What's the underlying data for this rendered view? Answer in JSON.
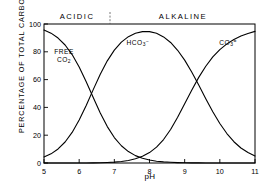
{
  "chart_data": {
    "type": "line",
    "title": "",
    "xlabel": "pH",
    "ylabel": "PERCENTAGE OF TOTAL CARBON",
    "xlim": [
      5,
      11
    ],
    "ylim": [
      0,
      100
    ],
    "xticks": [
      "5",
      "6",
      "7",
      "8",
      "9",
      "10",
      "11"
    ],
    "yticks": [
      "0",
      "20",
      "40",
      "60",
      "80",
      "100"
    ],
    "grid": false,
    "legend_position": "inline-annotations",
    "annotations": {
      "acidic": "ACIDIC",
      "alkaline": "ALKALINE",
      "divider_ph": 7,
      "free_co2_line1": "FREE",
      "free_co2_line2": "CO",
      "free_co2_sub": "2",
      "hco3_text": "HCO",
      "hco3_sub": "3",
      "hco3_sup": "−",
      "co3_text": "CO",
      "co3_sub": "3",
      "co3_sup": "="
    },
    "pka1": 6.35,
    "pka2": 9.1,
    "x": [
      5.0,
      5.2,
      5.4,
      5.6,
      5.8,
      6.0,
      6.2,
      6.4,
      6.6,
      6.8,
      7.0,
      7.2,
      7.4,
      7.6,
      7.8,
      8.0,
      8.2,
      8.4,
      8.6,
      8.8,
      9.0,
      9.2,
      9.4,
      9.6,
      9.8,
      10.0,
      10.2,
      10.4,
      10.6,
      10.8,
      11.0
    ],
    "series": [
      {
        "name": "FREE CO2",
        "color": "#000000",
        "values": [
          95.7,
          93.4,
          89.9,
          84.9,
          78.0,
          69.1,
          58.5,
          47.1,
          36.0,
          26.2,
          18.3,
          12.4,
          8.2,
          5.3,
          3.4,
          2.1,
          1.3,
          0.8,
          0.5,
          0.3,
          0.2,
          0.1,
          0.07,
          0.04,
          0.02,
          0.01,
          0.007,
          0.004,
          0.002,
          0.001,
          0.0006
        ]
      },
      {
        "name": "HCO3-",
        "color": "#000000",
        "values": [
          4.3,
          6.6,
          10.1,
          15.1,
          22.0,
          30.9,
          41.4,
          52.8,
          63.8,
          73.5,
          81.2,
          87.0,
          90.9,
          93.3,
          94.5,
          94.5,
          93.3,
          90.7,
          86.7,
          81.1,
          74.0,
          65.5,
          56.1,
          46.3,
          36.9,
          28.4,
          21.2,
          15.3,
          10.8,
          7.5,
          5.1
        ]
      },
      {
        "name": "CO3=",
        "color": "#000000",
        "values": [
          0.0003,
          0.0008,
          0.002,
          0.005,
          0.011,
          0.025,
          0.052,
          0.105,
          0.2,
          0.37,
          0.64,
          1.1,
          1.8,
          3.0,
          4.8,
          7.5,
          11.4,
          16.9,
          24.1,
          32.9,
          42.6,
          52.4,
          61.6,
          69.6,
          76.3,
          81.6,
          85.7,
          88.9,
          91.3,
          93.2,
          94.7
        ]
      }
    ]
  },
  "axis": {
    "x_title": "pH",
    "y_title": "PERCENTAGE OF TOTAL CARBON"
  }
}
